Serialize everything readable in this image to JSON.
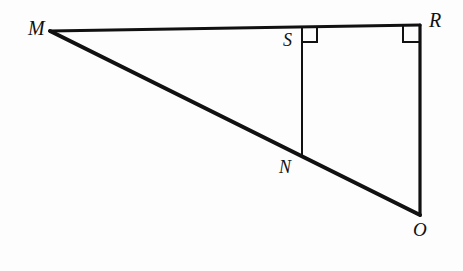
{
  "figure": {
    "kind": "geometry-diagram",
    "background_color": "#fdfdfd",
    "stroke_color": "#111111",
    "canvas": {
      "width": 463,
      "height": 271
    },
    "points": [
      {
        "id": "M",
        "label": "M",
        "x": 50,
        "y": 31,
        "role": "triangle-vertex"
      },
      {
        "id": "R",
        "label": "R",
        "x": 420,
        "y": 25,
        "role": "triangle-vertex"
      },
      {
        "id": "O",
        "label": "O",
        "x": 420,
        "y": 215,
        "role": "triangle-vertex"
      },
      {
        "id": "S",
        "label": "S",
        "x": 302,
        "y": 27,
        "role": "point-on-segment-MR"
      },
      {
        "id": "N",
        "label": "N",
        "x": 302,
        "y": 158,
        "role": "point-on-segment-MO"
      }
    ],
    "segments": [
      {
        "id": "MR",
        "from": "M",
        "to": "R",
        "width": 3.2,
        "note": "top side of triangle"
      },
      {
        "id": "RO",
        "from": "R",
        "to": "O",
        "width": 3.2,
        "note": "right vertical side"
      },
      {
        "id": "MO",
        "from": "M",
        "to": "O",
        "width": 4.0,
        "note": "long diagonal hypotenuse"
      },
      {
        "id": "SN",
        "from": "S",
        "to": "N",
        "width": 2.0,
        "note": "interior vertical segment"
      }
    ],
    "right_angles": [
      {
        "id": "angle-at-S",
        "at": "S",
        "size": 15,
        "opens": "right-down",
        "note": "SN perpendicular to MR"
      },
      {
        "id": "angle-at-R",
        "at": "R",
        "size": 17,
        "opens": "left-down",
        "note": "RO perpendicular to MR"
      }
    ],
    "labels": {
      "M": "M",
      "R": "R",
      "S": "S",
      "N": "N",
      "O": "O"
    }
  }
}
